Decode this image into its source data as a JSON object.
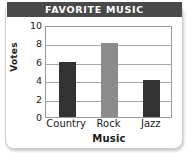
{
  "card": {
    "title": "FAVORITE MUSIC"
  },
  "chart_data": {
    "type": "bar",
    "title": "FAVORITE MUSIC",
    "categories": [
      "Country",
      "Rock",
      "Jazz"
    ],
    "values": [
      6,
      8,
      4
    ],
    "xlabel": "Music",
    "ylabel": "Votes",
    "ylim": [
      0,
      10
    ],
    "yticks": [
      10,
      8,
      6,
      4,
      2,
      0
    ],
    "grid": "horizontal",
    "legend": "none",
    "bar_colors": [
      "#333333",
      "#8c8c8c",
      "#333333"
    ]
  },
  "colors": {
    "title_bar": "#4a4a4a",
    "title_text": "#ffffff",
    "axis": "#9a9a9a",
    "gridline": "#a8a8a8",
    "text": "#1b1b1b",
    "card_background": "#ffffff"
  }
}
